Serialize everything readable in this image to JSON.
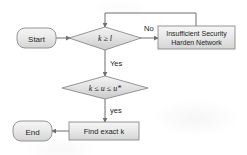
{
  "diagram": {
    "type": "flowchart",
    "background_color": "#ffffff",
    "node_fill_top": "#f2f2f2",
    "node_fill_bottom": "#d9d9d9",
    "node_stroke": "#8a8a8a",
    "connector_color": "#6f6f6f",
    "text_color": "#1c1c1c"
  },
  "nodes": {
    "start": {
      "label": "Start",
      "shape": "rounded-rectangle"
    },
    "decision_k_ge_l": {
      "label": "k ≥ l",
      "shape": "diamond"
    },
    "insufficient_security": {
      "line1": "Insufficient Security",
      "line2": "Harden Network",
      "shape": "rectangle"
    },
    "decision_k_le_u": {
      "label": "k ≤ u ≤ u*",
      "shape": "diamond"
    },
    "find_exact_k": {
      "label": "Find exact k",
      "shape": "rectangle"
    },
    "end": {
      "label": "End",
      "shape": "rounded-rectangle"
    }
  },
  "edges": {
    "start_to_decision1": {
      "label": ""
    },
    "decision1_no": {
      "label": "No"
    },
    "decision1_yes": {
      "label": "Yes"
    },
    "decision2_yes": {
      "label": "yes"
    },
    "feedback_loop": {
      "label": ""
    },
    "find_to_end": {
      "label": ""
    }
  }
}
